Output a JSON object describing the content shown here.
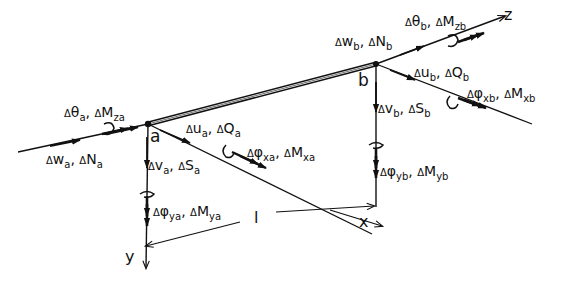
{
  "diagram": {
    "colors": {
      "ink": "#111111",
      "background": "#ffffff"
    },
    "nodes": {
      "a": {
        "label": "a"
      },
      "b": {
        "label": "b"
      }
    },
    "axes": {
      "x": "x",
      "y": "y",
      "z": "z"
    },
    "length_label": "l",
    "node_a_labels": {
      "theta_Mz": {
        "d1": "Δ",
        "s1": "θ",
        "sub1": "a",
        "sep": ", ",
        "d2": "Δ",
        "s2": "M",
        "sub2": "za"
      },
      "w_N": {
        "d1": "Δ",
        "s1": "w",
        "sub1": "a",
        "sep": ", ",
        "d2": "Δ",
        "s2": "N",
        "sub2": "a"
      },
      "u_Q": {
        "d1": "Δ",
        "s1": "u",
        "sub1": "a",
        "sep": ", ",
        "d2": "Δ",
        "s2": "Q",
        "sub2": "a"
      },
      "v_S": {
        "d1": "Δ",
        "s1": "v",
        "sub1": "a",
        "sep": ", ",
        "d2": "Δ",
        "s2": "S",
        "sub2": "a"
      },
      "phix_Mx": {
        "d1": "Δ",
        "s1": "φ",
        "sub1": "xa",
        "sep": ", ",
        "d2": "Δ",
        "s2": "M",
        "sub2": "xa"
      },
      "phiy_My": {
        "d1": "Δ",
        "s1": "φ",
        "sub1": "ya",
        "sep": ", ",
        "d2": "Δ",
        "s2": "M",
        "sub2": "ya"
      }
    },
    "node_b_labels": {
      "theta_Mz": {
        "d1": "Δ",
        "s1": "θ",
        "sub1": "b",
        "sep": ", ",
        "d2": "Δ",
        "s2": "M",
        "sub2": "zb"
      },
      "w_N": {
        "d1": "Δ",
        "s1": "w",
        "sub1": "b",
        "sep": ", ",
        "d2": "Δ",
        "s2": "N",
        "sub2": "b"
      },
      "u_Q": {
        "d1": "Δ",
        "s1": "u",
        "sub1": "b",
        "sep": ", ",
        "d2": "Δ",
        "s2": "Q",
        "sub2": "b"
      },
      "v_S": {
        "d1": "Δ",
        "s1": "v",
        "sub1": "b",
        "sep": ", ",
        "d2": "Δ",
        "s2": "S",
        "sub2": "b"
      },
      "phix_Mx": {
        "d1": "Δ",
        "s1": "φ",
        "sub1": "xb",
        "sep": ", ",
        "d2": "Δ",
        "s2": "M",
        "sub2": "xb"
      },
      "phiy_My": {
        "d1": "Δ",
        "s1": "φ",
        "sub1": "yb",
        "sep": ", ",
        "d2": "Δ",
        "s2": "M",
        "sub2": "yb"
      }
    }
  }
}
